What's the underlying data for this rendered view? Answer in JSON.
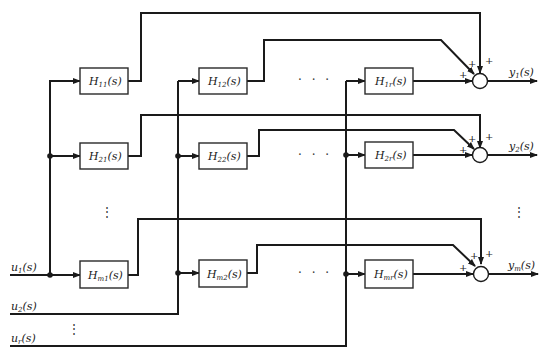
{
  "inputs": [
    {
      "label": "u",
      "sub": "1",
      "arg": "(s)"
    },
    {
      "label": "u",
      "sub": "2",
      "arg": "(s)"
    },
    {
      "label": "u",
      "sub": "r",
      "arg": "(s)"
    }
  ],
  "outputs": [
    {
      "label": "y",
      "sub": "1",
      "arg": "(s)"
    },
    {
      "label": "y",
      "sub": "2",
      "arg": "(s)"
    },
    {
      "label": "y",
      "sub": "m",
      "arg": "(s)"
    }
  ],
  "blocks": {
    "row1": [
      {
        "label": "H",
        "sub": "11",
        "arg": "(s)"
      },
      {
        "label": "H",
        "sub": "12",
        "arg": "(s)"
      },
      {
        "label": "H",
        "sub": "1r",
        "arg": "(s)"
      }
    ],
    "row2": [
      {
        "label": "H",
        "sub": "21",
        "arg": "(s)"
      },
      {
        "label": "H",
        "sub": "22",
        "arg": "(s)"
      },
      {
        "label": "H",
        "sub": "2r",
        "arg": "(s)"
      }
    ],
    "rowm": [
      {
        "label": "H",
        "sub": "m1",
        "arg": "(s)"
      },
      {
        "label": "H",
        "sub": "m2",
        "arg": "(s)"
      },
      {
        "label": "H",
        "sub": "mr",
        "arg": "(s)"
      }
    ]
  },
  "summing_signs": {
    "plus": "+"
  },
  "ellipsis": {
    "horizontal": "· · ·",
    "vertical": "⋮"
  }
}
